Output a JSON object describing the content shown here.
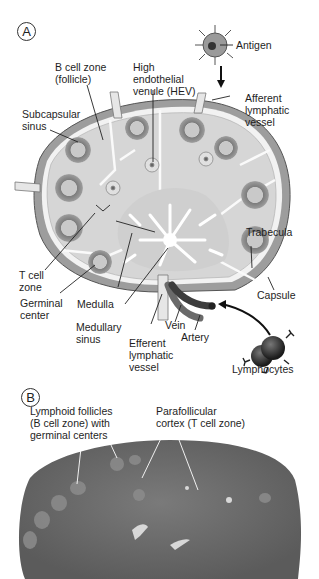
{
  "panels": [
    {
      "id": "A",
      "letter": "A",
      "type": "illustration",
      "subject": "lymph node cross-section"
    },
    {
      "id": "B",
      "letter": "B",
      "type": "micrograph",
      "subject": "lymph node histology"
    }
  ],
  "panel_a": {
    "labels": {
      "antigen": "Antigen",
      "b_cell_zone": "B cell zone\n(follicle)",
      "hev": "High\nendothelial\nvenule (HEV)",
      "afferent": "Afferent\nlymphatic\nvessel",
      "subcapsular": "Subcapsular\nsinus",
      "trabecula": "Trabecula",
      "t_cell_zone": "T cell\nzone",
      "capsule": "Capsule",
      "germinal": "Germinal\ncenter",
      "medulla": "Medulla",
      "medullary_sinus": "Medullary\nsinus",
      "efferent": "Efferent\nlymphatic\nvessel",
      "vein": "Vein",
      "artery": "Artery",
      "lymphocytes": "Lymphocytes"
    }
  },
  "panel_b": {
    "labels": {
      "follicles": "Lymphoid follicles\n(B cell zone) with\ngerminal centers",
      "parafollicular": "Parafollicular\ncortex (T cell zone)"
    }
  },
  "colors": {
    "capsule": "#9a9a9a",
    "parenchyma": "#d6d6d6",
    "follicle_ring": "#8a8a8a",
    "sinus": "#ffffff",
    "micrograph": "#6e6e6e"
  }
}
